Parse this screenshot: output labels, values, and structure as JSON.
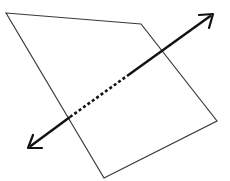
{
  "diagram": {
    "plane": {
      "vertices": [
        [
          6,
          13
        ],
        [
          141,
          24
        ],
        [
          217,
          121
        ],
        [
          104,
          178
        ]
      ],
      "stroke": "#3a3a3a",
      "stroke_width": 1.2
    },
    "line": {
      "start": [
        28,
        148
      ],
      "end": [
        213,
        14
      ],
      "entry_point": [
        70,
        117
      ],
      "dash_end": [
        127,
        76
      ],
      "stroke": "#111111",
      "stroke_width": 2.4,
      "arrows": "both"
    }
  }
}
